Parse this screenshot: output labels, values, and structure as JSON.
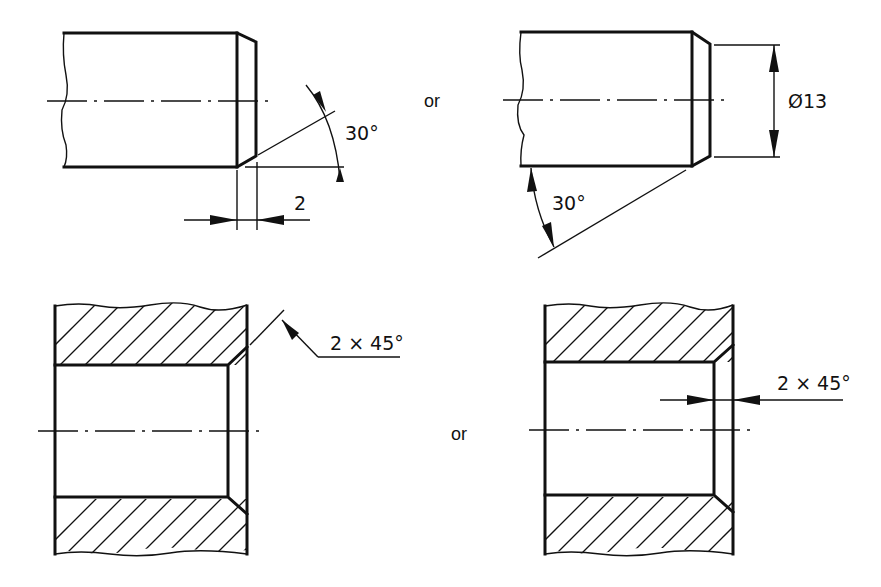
{
  "figure": {
    "type": "technical-drawing-chamfer-dimensioning",
    "separator_text": "or",
    "views": [
      {
        "id": "shaft-axial-chamfer",
        "description": "Shaft end with chamfer dimensioned by axial length and angle",
        "dimensions": {
          "length": "2",
          "angle": "30°"
        }
      },
      {
        "id": "shaft-diameter-chamfer",
        "description": "Shaft end with chamfer dimensioned by diameter and angle",
        "dimensions": {
          "diameter": "Ø13",
          "angle": "30°"
        }
      },
      {
        "id": "bore-leader-chamfer",
        "description": "Sectioned bore with chamfer callout via leader",
        "dimensions": {
          "callout": "2 × 45°"
        }
      },
      {
        "id": "bore-arrow-chamfer",
        "description": "Sectioned bore with chamfer dimensioned by arrows",
        "dimensions": {
          "callout": "2 × 45°"
        }
      }
    ]
  }
}
